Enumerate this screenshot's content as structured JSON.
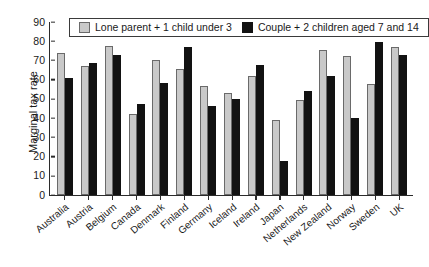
{
  "chart_data": {
    "type": "bar",
    "title": "",
    "xlabel": "",
    "ylabel": "Marginal tax rate",
    "ylim": [
      0,
      90
    ],
    "yticks": [
      0,
      10,
      20,
      30,
      40,
      50,
      60,
      70,
      80,
      90
    ],
    "grid": false,
    "legend_position": "top-inside",
    "categories": [
      "Australia",
      "Austria",
      "Belgium",
      "Canada",
      "Denmark",
      "Finland",
      "Germany",
      "Iceland",
      "Ireland",
      "Japan",
      "Netherlands",
      "New Zealand",
      "Norway",
      "Sweden",
      "UK"
    ],
    "series": [
      {
        "name": "Lone parent + 1 child under 3",
        "color": "#c9c9c9",
        "values": [
          74,
          67,
          77.5,
          42,
          70,
          65.5,
          56.5,
          53,
          62,
          39,
          49.5,
          75.5,
          72.5,
          57.5,
          77
        ]
      },
      {
        "name": "Couple + 2 children aged 7 and 14",
        "color": "#121212",
        "values": [
          61,
          68.5,
          73,
          47.5,
          58.5,
          77,
          46.5,
          50,
          67.5,
          17.5,
          54,
          62,
          40,
          79.5,
          73
        ]
      }
    ]
  },
  "axis": {
    "y_title": "Marginal tax rate"
  }
}
